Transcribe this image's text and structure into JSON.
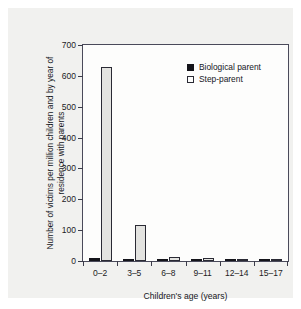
{
  "figure": {
    "background_color": "#f1f1ef",
    "plot_background_color": "#fdfdfc",
    "frame_color": "#4a4a5a"
  },
  "chart_data": {
    "type": "bar",
    "title": "",
    "xlabel": "Children's age (years)",
    "ylabel": "Number of victims per million children and by year of residence with parents",
    "categories": [
      "0–2",
      "3–5",
      "6–8",
      "9–11",
      "12–14",
      "15–17"
    ],
    "series": [
      {
        "name": "Biological parent",
        "color": "#14141a",
        "fill": "solid",
        "values": [
          9,
          7,
          6,
          2,
          1,
          0.5
        ]
      },
      {
        "name": "Step-parent",
        "color": "#ffffff",
        "fill": "open",
        "values": [
          630,
          118,
          13,
          9,
          7,
          4
        ]
      }
    ],
    "ylim": [
      0,
      700
    ],
    "yticks": [
      0,
      100,
      200,
      300,
      400,
      500,
      600,
      700
    ],
    "ytick_labels": [
      "0",
      "100",
      "200",
      "300",
      "400",
      "500",
      "600",
      "700"
    ],
    "grid": false,
    "legend_position": "top-right"
  },
  "legend": {
    "entries": [
      {
        "label": "Biological parent",
        "swatch": "filled-square"
      },
      {
        "label": "Step-parent",
        "swatch": "open-square"
      }
    ]
  }
}
